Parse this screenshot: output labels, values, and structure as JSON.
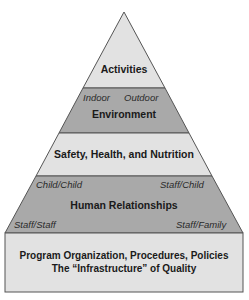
{
  "diagram": {
    "type": "pyramid",
    "colors": {
      "light": "#e2e2e2",
      "dark": "#a9a9a9",
      "stroke": "#555555"
    },
    "layers": [
      {
        "id": "activities",
        "title": "Activities",
        "shade": "light"
      },
      {
        "id": "environment",
        "title": "Environment",
        "shade": "dark",
        "sublabels": {
          "left": "Indoor",
          "right": "Outdoor"
        }
      },
      {
        "id": "safety",
        "title": "Safety, Health, and Nutrition",
        "shade": "light"
      },
      {
        "id": "relationships",
        "title": "Human Relationships",
        "shade": "dark",
        "sublabels": {
          "top_left": "Child/Child",
          "top_right": "Staff/Child",
          "bottom_left": "Staff/Staff",
          "bottom_right": "Staff/Family"
        }
      },
      {
        "id": "base",
        "title_line1": "Program Organization, Procedures, Policies",
        "title_line2": "The “Infrastructure” of Quality",
        "shade": "light"
      }
    ]
  }
}
